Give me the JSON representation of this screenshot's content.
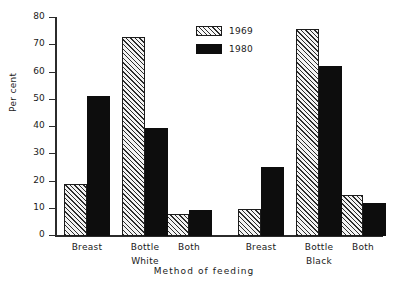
{
  "chart_data": {
    "type": "bar",
    "title": "",
    "xlabel": "Method of feeding",
    "ylabel": "Per cent",
    "ylim": [
      0,
      80
    ],
    "ytick_step": 10,
    "yticks": [
      0,
      10,
      20,
      30,
      40,
      50,
      60,
      70,
      80
    ],
    "ytick_labels": [
      "0",
      "10",
      "20",
      "30",
      "40",
      "50",
      "60",
      "70",
      "80"
    ],
    "grid": false,
    "legend_position": "top-center",
    "categories": [
      "Breast",
      "Bottle",
      "Both",
      "Breast",
      "Bottle",
      "Both"
    ],
    "groups": [
      {
        "label": "White",
        "categories": [
          "Breast",
          "Bottle",
          "Both"
        ]
      },
      {
        "label": "Black",
        "categories": [
          "Breast",
          "Bottle",
          "Both"
        ]
      }
    ],
    "series": [
      {
        "name": "1969",
        "style": "hatched",
        "values": [
          19,
          73,
          8,
          10,
          76,
          15
        ]
      },
      {
        "name": "1980",
        "style": "solid",
        "color": "#0d0d0d",
        "values": [
          51.5,
          39.5,
          9.5,
          25.5,
          62.5,
          12
        ]
      }
    ],
    "legend": [
      {
        "label": "1969",
        "style": "hatched"
      },
      {
        "label": "1980",
        "style": "solid"
      }
    ]
  },
  "axis": {
    "y_title": "Per cent",
    "x_title": "Method of feeding"
  }
}
